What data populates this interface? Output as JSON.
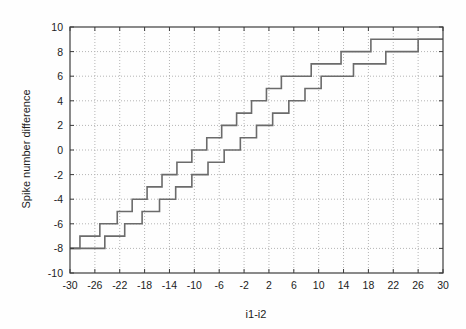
{
  "chart_data": {
    "type": "line",
    "title": "",
    "xlabel": "i1-i2",
    "ylabel": "Spike number difference",
    "xlim": [
      -30,
      30
    ],
    "ylim": [
      -10,
      10
    ],
    "xticks": [
      -30,
      -26,
      -22,
      -18,
      -14,
      -10,
      -6,
      -2,
      2,
      6,
      10,
      14,
      18,
      22,
      26,
      30
    ],
    "yticks": [
      -10,
      -8,
      -6,
      -4,
      -2,
      0,
      2,
      4,
      6,
      8,
      10
    ],
    "xtick_labels": [
      "-30",
      "-26",
      "-22",
      "-18",
      "-14",
      "-10",
      "-6",
      "-2",
      "2",
      "6",
      "10",
      "14",
      "18",
      "22",
      "26",
      "30"
    ],
    "ytick_labels": [
      "-10",
      "-8",
      "-6",
      "-4",
      "-2",
      "0",
      "2",
      "4",
      "6",
      "8",
      "10"
    ],
    "grid": true,
    "grid_style": "dotted",
    "grid_color": "#b4b4b4",
    "legend": "none",
    "line_color": "#6b6b6b",
    "line_width": 1.6,
    "background": "#fefefe",
    "axis_color": "#3c3c3c",
    "series": [
      {
        "name": "upper-staircase",
        "step_type": "post",
        "x": [
          -30,
          -28.4,
          -28.4,
          -25.2,
          -25.2,
          -22.4,
          -22.4,
          -20.0,
          -20.0,
          -17.6,
          -17.6,
          -15.2,
          -15.2,
          -12.8,
          -12.8,
          -10.4,
          -10.4,
          -8.0,
          -8.0,
          -5.6,
          -5.6,
          -3.2,
          -3.2,
          -0.8,
          -0.8,
          1.6,
          1.6,
          4.0,
          4.0,
          6.4,
          6.4,
          8.8,
          8.8,
          11.2,
          11.2,
          13.6,
          13.6,
          16.0,
          16.0,
          18.4,
          18.4,
          21.0,
          21.0,
          30
        ],
        "y": [
          -8,
          -8,
          -7,
          -7,
          -6,
          -6,
          -5,
          -5,
          -4,
          -4,
          -3,
          -3,
          -2,
          -2,
          -1,
          -1,
          0,
          0,
          1,
          1,
          2,
          2,
          3,
          3,
          4,
          4,
          5,
          5,
          6,
          6,
          6,
          6,
          7,
          7,
          7,
          7,
          8,
          8,
          8,
          8,
          9,
          9,
          9,
          9
        ]
      },
      {
        "name": "lower-staircase",
        "step_type": "post",
        "x": [
          -30,
          -24.4,
          -24.4,
          -21.2,
          -21.2,
          -18.4,
          -18.4,
          -15.6,
          -15.6,
          -13.0,
          -13.0,
          -10.4,
          -10.4,
          -7.8,
          -7.8,
          -5.2,
          -5.2,
          -2.6,
          -2.6,
          0.0,
          0.0,
          2.6,
          2.6,
          5.2,
          5.2,
          7.8,
          7.8,
          10.4,
          10.4,
          13.0,
          13.0,
          15.6,
          15.6,
          18.2,
          18.2,
          20.8,
          20.8,
          23.4,
          23.4,
          26.0,
          26.0,
          30
        ],
        "y": [
          -8,
          -8,
          -7,
          -7,
          -6,
          -6,
          -5,
          -5,
          -4,
          -4,
          -3,
          -3,
          -2,
          -2,
          -1,
          -1,
          0,
          0,
          1,
          1,
          2,
          2,
          3,
          3,
          4,
          4,
          5,
          5,
          6,
          6,
          6,
          6,
          7,
          7,
          7,
          7,
          8,
          8,
          8,
          8,
          9,
          9
        ]
      }
    ]
  }
}
